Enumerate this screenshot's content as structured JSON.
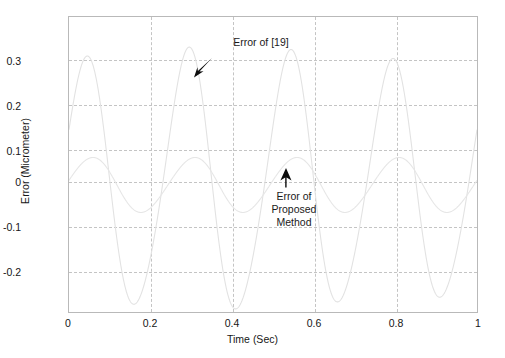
{
  "figure": {
    "background": "#ffffff",
    "frame_color": "#b9b9b9",
    "grid_color": "#c4c4c4"
  },
  "axes": {
    "xlabel": "Time (Sec)",
    "ylabel": "Error (Micrometer)",
    "xticks": [
      "0",
      "0.2",
      "0.4",
      "0.6",
      "0.8",
      "1"
    ],
    "yticks": [
      "0.3",
      "0.2",
      "0.1",
      "0",
      "-0.1",
      "-0.2"
    ]
  },
  "annotations": {
    "reference": {
      "text": "Error of [19]",
      "arrow": "arrow-down-left"
    },
    "proposed": {
      "line1": "Error of",
      "line2": "Proposed",
      "line3": "Method",
      "arrow": "arrow-up"
    }
  },
  "chart_data": {
    "type": "line",
    "title": "",
    "xlabel": "Time (Sec)",
    "ylabel": "Error (Micrometer)",
    "xlim": [
      0,
      1
    ],
    "ylim": [
      -0.282,
      0.381
    ],
    "xticks": [
      0,
      0.2,
      0.4,
      0.6,
      0.8,
      1
    ],
    "yticks": [
      0.3,
      0.2,
      0.1,
      0,
      -0.1,
      -0.2
    ],
    "grid": true,
    "legend": "none",
    "series": [
      {
        "name": "Error of [19]",
        "color": "#e2e2e2",
        "model": "damped-modulated-sinusoid",
        "frequency_hz": 4.0,
        "amplitude_peak": 0.285,
        "amplitude_trough": -0.272,
        "phase_offset": 0.04,
        "peaks_t": [
          0.04,
          0.29,
          0.53,
          0.79,
          0.96
        ],
        "peaks_y": [
          0.268,
          0.288,
          0.282,
          0.29,
          0.225
        ],
        "troughs_t": [
          0.17,
          0.41,
          0.65,
          0.9
        ],
        "troughs_y": [
          -0.272,
          -0.268,
          -0.262,
          -0.275
        ]
      },
      {
        "name": "Error of Proposed Method",
        "color": "#e6e6e6",
        "model": "sinusoid",
        "frequency_hz": 4.0,
        "amplitude_peak": 0.065,
        "amplitude_trough": -0.058,
        "phase_offset": 0.055,
        "peaks_t": [
          0.055,
          0.305,
          0.555,
          0.805
        ],
        "peaks_y": [
          0.062,
          0.065,
          0.064,
          0.066
        ],
        "troughs_t": [
          0.18,
          0.43,
          0.68,
          0.93
        ],
        "troughs_y": [
          -0.055,
          -0.056,
          -0.054,
          -0.057
        ]
      }
    ]
  }
}
